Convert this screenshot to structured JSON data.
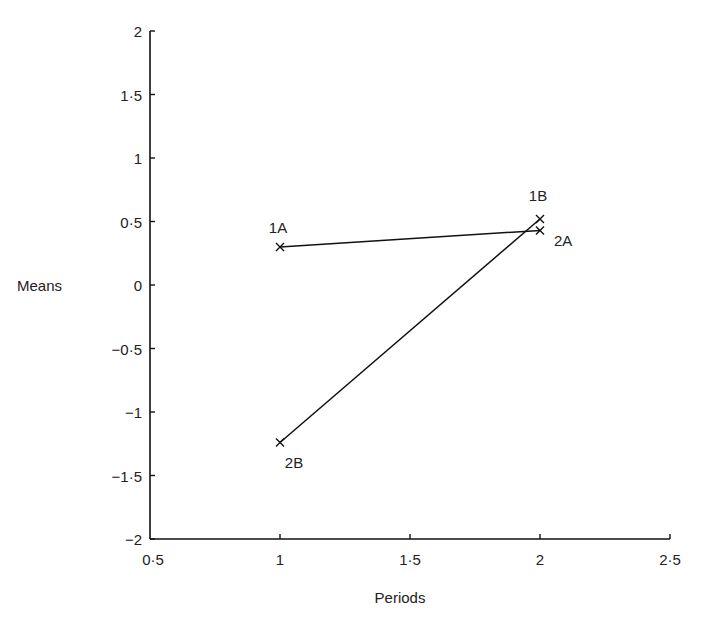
{
  "chart_data": {
    "type": "line",
    "title": "",
    "xlabel": "Periods",
    "ylabel": "Means",
    "xlim": [
      0.5,
      2.5
    ],
    "ylim": [
      -2,
      2
    ],
    "x_ticks": [
      "0·5",
      "1",
      "1·5",
      "2",
      "2·5"
    ],
    "y_ticks": [
      "2",
      "1·5",
      "1",
      "0·5",
      "0",
      "−0·5",
      "−1",
      "−1·5",
      "−2"
    ],
    "grid": false,
    "legend": null,
    "series": [
      {
        "name": "A",
        "points": [
          {
            "label": "1A",
            "x": 1,
            "y": 0.3
          },
          {
            "label": "2A",
            "x": 2,
            "y": 0.43
          }
        ]
      },
      {
        "name": "B",
        "points": [
          {
            "label": "2B",
            "x": 1,
            "y": -1.24
          },
          {
            "label": "1B",
            "x": 2,
            "y": 0.52
          }
        ]
      }
    ],
    "marker": "x"
  }
}
